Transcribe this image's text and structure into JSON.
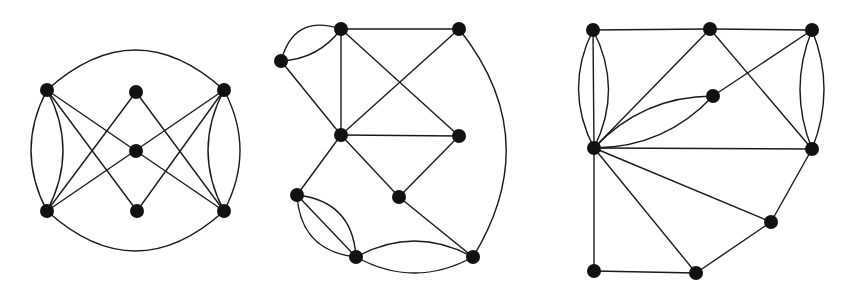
{
  "figure": {
    "node_radius": 7,
    "colors": {
      "node": "#111111",
      "edge": "#1a1a1a",
      "background": "#ffffff"
    }
  },
  "graphs": [
    {
      "id": "graph-1",
      "nodes": [
        {
          "id": "A",
          "x": 47,
          "y": 90
        },
        {
          "id": "B",
          "x": 136,
          "y": 92
        },
        {
          "id": "C",
          "x": 224,
          "y": 90
        },
        {
          "id": "D",
          "x": 136,
          "y": 151
        },
        {
          "id": "E",
          "x": 47,
          "y": 211
        },
        {
          "id": "F",
          "x": 137,
          "y": 211
        },
        {
          "id": "G",
          "x": 224,
          "y": 211
        }
      ],
      "edges": [
        {
          "from": "A",
          "to": "C",
          "curve": -40
        },
        {
          "from": "E",
          "to": "G",
          "curve": 40
        },
        {
          "from": "A",
          "to": "E",
          "curve": -16
        },
        {
          "from": "A",
          "to": "E",
          "curve": 16
        },
        {
          "from": "C",
          "to": "G",
          "curve": -16
        },
        {
          "from": "C",
          "to": "G",
          "curve": 16
        },
        {
          "from": "A",
          "to": "D",
          "curve": 0
        },
        {
          "from": "A",
          "to": "F",
          "curve": 0
        },
        {
          "from": "B",
          "to": "E",
          "curve": 0
        },
        {
          "from": "B",
          "to": "G",
          "curve": 0
        },
        {
          "from": "D",
          "to": "G",
          "curve": 0
        },
        {
          "from": "C",
          "to": "F",
          "curve": 0
        },
        {
          "from": "C",
          "to": "E",
          "curve": 0
        }
      ]
    },
    {
      "id": "graph-2",
      "nodes": [
        {
          "id": "P1",
          "x": 341,
          "y": 29
        },
        {
          "id": "P2",
          "x": 459,
          "y": 29
        },
        {
          "id": "P3",
          "x": 281,
          "y": 61
        },
        {
          "id": "P4",
          "x": 341,
          "y": 135
        },
        {
          "id": "P5",
          "x": 459,
          "y": 136
        },
        {
          "id": "P6",
          "x": 297,
          "y": 195
        },
        {
          "id": "P7",
          "x": 399,
          "y": 197
        },
        {
          "id": "P8",
          "x": 356,
          "y": 257
        },
        {
          "id": "P9",
          "x": 473,
          "y": 257
        }
      ],
      "edges": [
        {
          "from": "P1",
          "to": "P2",
          "curve": 0
        },
        {
          "from": "P3",
          "to": "P1",
          "curve": -18
        },
        {
          "from": "P3",
          "to": "P1",
          "curve": 8
        },
        {
          "from": "P1",
          "to": "P4",
          "curve": 0
        },
        {
          "from": "P1",
          "to": "P5",
          "curve": 0
        },
        {
          "from": "P2",
          "to": "P4",
          "curve": 0
        },
        {
          "from": "P2",
          "to": "P9",
          "curve": -40
        },
        {
          "from": "P3",
          "to": "P4",
          "curve": 0
        },
        {
          "from": "P4",
          "to": "P5",
          "curve": 0
        },
        {
          "from": "P4",
          "to": "P6",
          "curve": 0
        },
        {
          "from": "P4",
          "to": "P7",
          "curve": 0
        },
        {
          "from": "P5",
          "to": "P7",
          "curve": 0
        },
        {
          "from": "P7",
          "to": "P9",
          "curve": 0
        },
        {
          "from": "P6",
          "to": "P8",
          "curve": 0
        },
        {
          "from": "P6",
          "to": "P8",
          "curve": -18
        },
        {
          "from": "P6",
          "to": "P8",
          "curve": 18
        },
        {
          "from": "P8",
          "to": "P9",
          "curve": -16
        },
        {
          "from": "P8",
          "to": "P9",
          "curve": 16
        }
      ]
    },
    {
      "id": "graph-3",
      "nodes": [
        {
          "id": "Q1",
          "x": 593,
          "y": 30
        },
        {
          "id": "Q2",
          "x": 710,
          "y": 29
        },
        {
          "id": "Q3",
          "x": 812,
          "y": 30
        },
        {
          "id": "Q4",
          "x": 713,
          "y": 96
        },
        {
          "id": "Q5",
          "x": 594,
          "y": 148
        },
        {
          "id": "Q6",
          "x": 812,
          "y": 149
        },
        {
          "id": "Q7",
          "x": 771,
          "y": 222
        },
        {
          "id": "Q8",
          "x": 594,
          "y": 271
        },
        {
          "id": "Q9",
          "x": 696,
          "y": 273
        }
      ],
      "edges": [
        {
          "from": "Q1",
          "to": "Q2",
          "curve": 0
        },
        {
          "from": "Q2",
          "to": "Q3",
          "curve": 0
        },
        {
          "from": "Q1",
          "to": "Q5",
          "curve": 0
        },
        {
          "from": "Q1",
          "to": "Q5",
          "curve": -15
        },
        {
          "from": "Q1",
          "to": "Q5",
          "curve": 15
        },
        {
          "from": "Q3",
          "to": "Q6",
          "curve": -12
        },
        {
          "from": "Q3",
          "to": "Q6",
          "curve": 12
        },
        {
          "from": "Q2",
          "to": "Q5",
          "curve": 0
        },
        {
          "from": "Q2",
          "to": "Q6",
          "curve": 0
        },
        {
          "from": "Q3",
          "to": "Q4",
          "curve": 0
        },
        {
          "from": "Q4",
          "to": "Q5",
          "curve": 14
        },
        {
          "from": "Q4",
          "to": "Q5",
          "curve": -14
        },
        {
          "from": "Q5",
          "to": "Q6",
          "curve": 0
        },
        {
          "from": "Q5",
          "to": "Q7",
          "curve": 0
        },
        {
          "from": "Q5",
          "to": "Q9",
          "curve": 0
        },
        {
          "from": "Q5",
          "to": "Q8",
          "curve": 0
        },
        {
          "from": "Q6",
          "to": "Q7",
          "curve": 0
        },
        {
          "from": "Q7",
          "to": "Q9",
          "curve": 0
        },
        {
          "from": "Q8",
          "to": "Q9",
          "curve": 0
        }
      ]
    }
  ]
}
